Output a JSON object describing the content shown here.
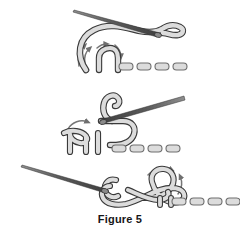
{
  "figure": {
    "caption": "Figure 5",
    "title": "Figure 5",
    "panel_count": 3,
    "background_color": "#ffffff"
  },
  "colors": {
    "background": "#ffffff",
    "thread_fill": "#d8d8d8",
    "thread_fill_light": "#e4e4e4",
    "thread_outline": "#3a3a3a",
    "needle_dark": "#4a4a4a",
    "needle_light": "#8e8e8e",
    "stitch_fill": "#dcdcdc",
    "stitch_outline": "#6e6e6e",
    "arrow_color": "#707070",
    "caption_color": "#161616"
  },
  "panels": [
    {
      "id": "panel-top",
      "index": 1,
      "label": "Step 1",
      "description": "Needle held above, thread loop formed with arrows indicating loop rotation, row of completed stitches to the right",
      "needle": {
        "name": "needle",
        "tip_x": 74,
        "tip_y": 10,
        "eye_x": 160,
        "eye_y": 33,
        "angle_deg": 15
      },
      "thread": {
        "name": "thread",
        "loop_count": 1
      },
      "arrows": [
        {
          "name": "rotation-arrow-left",
          "direction": "counterclockwise"
        },
        {
          "name": "rotation-arrow-right",
          "direction": "clockwise"
        }
      ],
      "stitches": {
        "count": 4,
        "start_x": 119,
        "y": 63,
        "width": 14,
        "height": 7,
        "gap": 4
      }
    },
    {
      "id": "panel-middle",
      "index": 2,
      "label": "Step 2",
      "description": "Needle passes through the loop from the right, thread begins forming the knot over the previous stitch",
      "needle": {
        "name": "needle",
        "tip_x": 96,
        "tip_y": 121,
        "eye_x": 184,
        "eye_y": 96,
        "angle_deg": -16
      },
      "thread": {
        "name": "thread",
        "loop_count": 2
      },
      "arrows": [
        {
          "name": "feed-arrow",
          "direction": "counterclockwise"
        }
      ],
      "stitches": {
        "count": 4,
        "start_x": 112,
        "y": 145,
        "width": 14,
        "height": 7,
        "gap": 4
      }
    },
    {
      "id": "panel-bottom",
      "index": 3,
      "label": "Step 3",
      "description": "Needle drawn to the left, thread tightened into a finished interlocking knot joining the stitch row",
      "needle": {
        "name": "needle",
        "tip_x": 22,
        "tip_y": 165,
        "eye_x": 106,
        "eye_y": 189,
        "angle_deg": 16
      },
      "thread": {
        "name": "thread",
        "loop_count": 2
      },
      "arrows": [
        {
          "name": "tighten-arrow",
          "direction": "clockwise"
        }
      ],
      "stitches": {
        "count": 4,
        "start_x": 172,
        "y": 198,
        "width": 14,
        "height": 7,
        "gap": 4
      }
    }
  ]
}
